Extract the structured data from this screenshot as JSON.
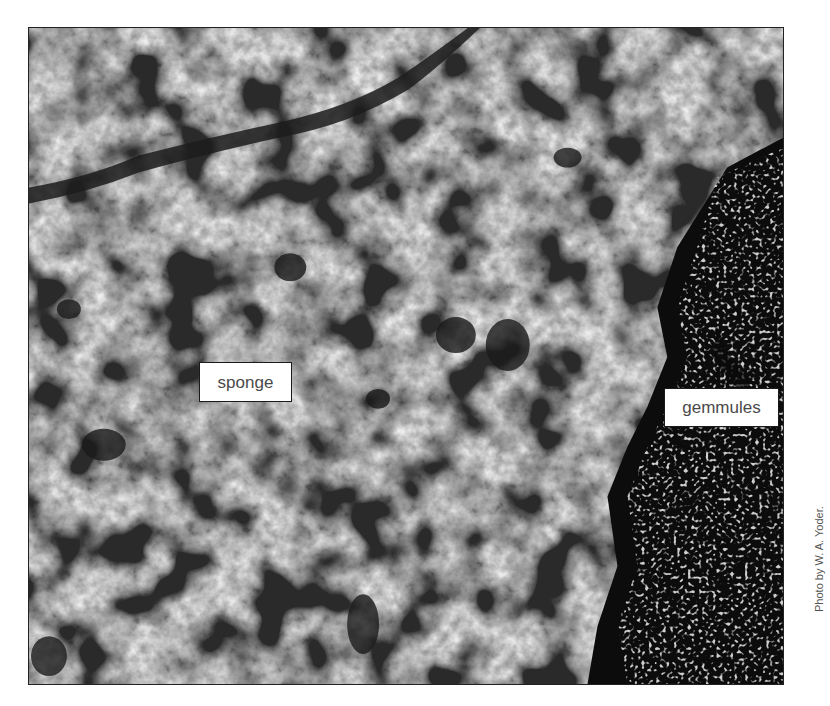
{
  "figure": {
    "labels": {
      "sponge": "sponge",
      "gemmules": "gemmules"
    },
    "credit": "Photo by W. A. Yoder.",
    "colors": {
      "background": "#ffffff",
      "label_bg": "#ffffff",
      "label_border": "#1a1a1a",
      "label_text": "#4a4a4a",
      "credit_text": "#555555"
    }
  }
}
